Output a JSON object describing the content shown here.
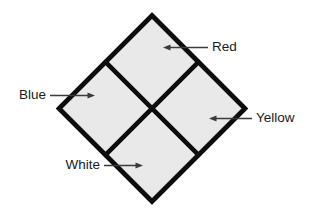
{
  "diagram": {
    "shape": {
      "name": "diamond",
      "fill_color": "#e9e9e9",
      "stroke_color": "#0d0d0d",
      "stroke_width": 4.6,
      "divider_stroke_width": 4.2,
      "center_x": 152,
      "center_y": 108.5,
      "half_diagonal_x": 93,
      "half_diagonal_y": 93
    },
    "labels": [
      {
        "id": "red",
        "text": "Red",
        "quadrant": "top",
        "text_x": 212,
        "text_y": 47.5,
        "anchor": "start",
        "line_x1": 208,
        "line_y1": 47.5,
        "line_x2": 166,
        "line_y2": 47.5,
        "arrow_x": 163,
        "arrow_y": 47.5,
        "arrow_direction": "left"
      },
      {
        "id": "blue",
        "text": "Blue",
        "quadrant": "left",
        "text_x": 46,
        "text_y": 95.5,
        "anchor": "end",
        "line_x1": 50,
        "line_y1": 95.5,
        "line_x2": 92,
        "line_y2": 95.5,
        "arrow_x": 95,
        "arrow_y": 95.5,
        "arrow_direction": "right"
      },
      {
        "id": "yellow",
        "text": "Yellow",
        "quadrant": "right",
        "text_x": 256,
        "text_y": 118.5,
        "anchor": "start",
        "line_x1": 252,
        "line_y1": 118.5,
        "line_x2": 212,
        "line_y2": 118.5,
        "arrow_x": 209,
        "arrow_y": 118.5,
        "arrow_direction": "left"
      },
      {
        "id": "white",
        "text": "White",
        "quadrant": "bottom",
        "text_x": 100,
        "text_y": 165.5,
        "anchor": "end",
        "line_x1": 104,
        "line_y1": 165.5,
        "line_x2": 140,
        "line_y2": 165.5,
        "arrow_x": 143,
        "arrow_y": 165.5,
        "arrow_direction": "right"
      }
    ]
  }
}
